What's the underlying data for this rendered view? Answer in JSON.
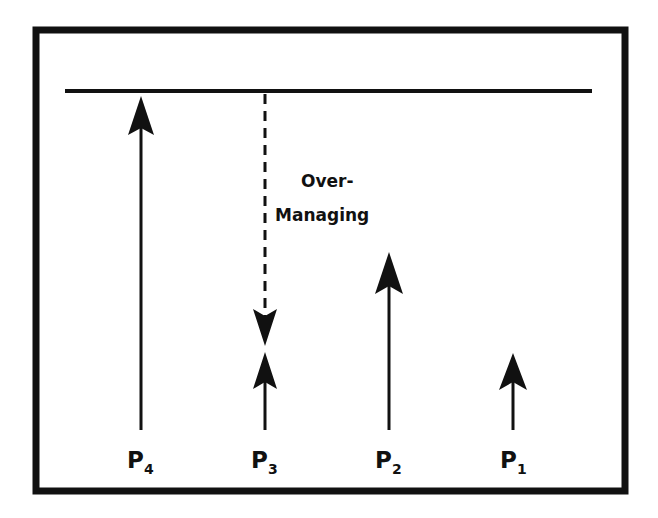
{
  "diagram": {
    "type": "arrow-level-diagram",
    "colors": {
      "background": "#ffffff",
      "ink": "#111111"
    },
    "frame": {
      "x": 36,
      "y": 30,
      "width": 590,
      "height": 461,
      "stroke_width": 7
    },
    "ceiling_line": {
      "x1": 65,
      "x2": 592,
      "y": 91
    },
    "annotation": {
      "line1": "Over-",
      "line2": "Managing"
    },
    "arrows": [
      {
        "id": "P4",
        "label_main": "P",
        "label_sub": "4",
        "x": 141,
        "tip_y": 96,
        "base_y": 430,
        "style": "solid-up"
      },
      {
        "id": "P3",
        "label_main": "P",
        "label_sub": "3",
        "x": 265,
        "tip_y": 352,
        "base_y": 430,
        "style": "solid-up"
      },
      {
        "id": "P2",
        "label_main": "P",
        "label_sub": "2",
        "x": 389,
        "tip_y": 252,
        "base_y": 430,
        "style": "solid-up"
      },
      {
        "id": "P1",
        "label_main": "P",
        "label_sub": "1",
        "x": 513,
        "tip_y": 353,
        "base_y": 430,
        "style": "solid-up"
      }
    ],
    "overmanaging_arrow": {
      "x": 265,
      "start_y": 94,
      "tip_y": 346,
      "style": "dashed-down"
    }
  }
}
